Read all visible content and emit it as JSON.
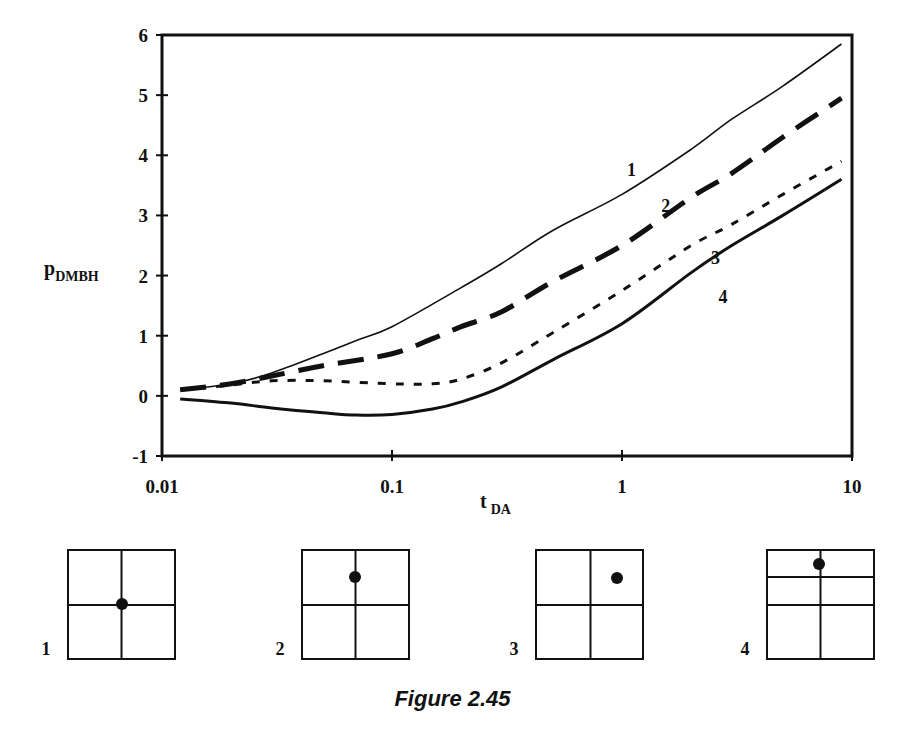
{
  "chart_data": {
    "type": "line",
    "title": "",
    "xlabel": "t_DA",
    "xlabel_main": "t",
    "xlabel_sub": "DA",
    "ylabel": "p_DMBH",
    "ylabel_main": "p",
    "ylabel_sub": "DMBH",
    "xscale": "log",
    "xlim": [
      0.01,
      10
    ],
    "ylim": [
      -1,
      6
    ],
    "grid": false,
    "legend": "inline curve numbers",
    "x_ticks": [
      {
        "value": 0.01,
        "label": "0.01"
      },
      {
        "value": 0.1,
        "label": "0.1"
      },
      {
        "value": 1,
        "label": "1"
      },
      {
        "value": 10,
        "label": "10"
      }
    ],
    "y_ticks": [
      {
        "value": 6,
        "label": "6"
      },
      {
        "value": 5,
        "label": "5"
      },
      {
        "value": 4,
        "label": "4"
      },
      {
        "value": 3,
        "label": "3"
      },
      {
        "value": 2,
        "label": "2"
      },
      {
        "value": 1,
        "label": "1"
      },
      {
        "value": 0,
        "label": "0"
      },
      {
        "value": -1,
        "label": "-1"
      }
    ],
    "series": [
      {
        "name": "1",
        "style": "thin-solid",
        "label_pos": {
          "x": 1.1,
          "y": 3.65
        },
        "points": [
          [
            0.012,
            0.1
          ],
          [
            0.02,
            0.2
          ],
          [
            0.03,
            0.38
          ],
          [
            0.05,
            0.7
          ],
          [
            0.07,
            0.92
          ],
          [
            0.1,
            1.15
          ],
          [
            0.2,
            1.8
          ],
          [
            0.3,
            2.2
          ],
          [
            0.5,
            2.75
          ],
          [
            1,
            3.35
          ],
          [
            2,
            4.1
          ],
          [
            3,
            4.6
          ],
          [
            5,
            5.15
          ],
          [
            9,
            5.85
          ]
        ]
      },
      {
        "name": "2",
        "style": "long-dash",
        "label_pos": {
          "x": 1.55,
          "y": 3.05
        },
        "points": [
          [
            0.012,
            0.1
          ],
          [
            0.02,
            0.2
          ],
          [
            0.03,
            0.33
          ],
          [
            0.05,
            0.5
          ],
          [
            0.1,
            0.7
          ],
          [
            0.15,
            0.95
          ],
          [
            0.2,
            1.15
          ],
          [
            0.3,
            1.4
          ],
          [
            0.5,
            1.9
          ],
          [
            1,
            2.5
          ],
          [
            2,
            3.3
          ],
          [
            3,
            3.7
          ],
          [
            5,
            4.3
          ],
          [
            9,
            4.95
          ]
        ]
      },
      {
        "name": "3",
        "style": "short-dash",
        "label_pos": {
          "x": 2.55,
          "y": 2.2
        },
        "points": [
          [
            0.012,
            0.1
          ],
          [
            0.02,
            0.18
          ],
          [
            0.03,
            0.25
          ],
          [
            0.05,
            0.25
          ],
          [
            0.1,
            0.2
          ],
          [
            0.15,
            0.2
          ],
          [
            0.2,
            0.28
          ],
          [
            0.3,
            0.55
          ],
          [
            0.5,
            1.05
          ],
          [
            1,
            1.75
          ],
          [
            2,
            2.5
          ],
          [
            3,
            2.85
          ],
          [
            5,
            3.35
          ],
          [
            9,
            3.9
          ]
        ]
      },
      {
        "name": "4",
        "style": "thick-solid",
        "label_pos": {
          "x": 2.75,
          "y": 1.55
        },
        "points": [
          [
            0.012,
            -0.05
          ],
          [
            0.02,
            -0.12
          ],
          [
            0.03,
            -0.2
          ],
          [
            0.05,
            -0.28
          ],
          [
            0.07,
            -0.32
          ],
          [
            0.1,
            -0.31
          ],
          [
            0.15,
            -0.22
          ],
          [
            0.2,
            -0.1
          ],
          [
            0.3,
            0.15
          ],
          [
            0.5,
            0.6
          ],
          [
            1,
            1.2
          ],
          [
            2,
            2.05
          ],
          [
            3,
            2.5
          ],
          [
            5,
            3.0
          ],
          [
            9,
            3.6
          ]
        ]
      }
    ]
  },
  "schematics": [
    {
      "label": "1",
      "description": "well at center of square reservoir (intersection of dividing lines)"
    },
    {
      "label": "2",
      "description": "well on vertical center line, upper half"
    },
    {
      "label": "3",
      "description": "well in upper-right quadrant"
    },
    {
      "label": "4",
      "description": "well on vertical center line near top, extra horizontal line in upper half"
    }
  ],
  "caption": "Figure 2.45"
}
